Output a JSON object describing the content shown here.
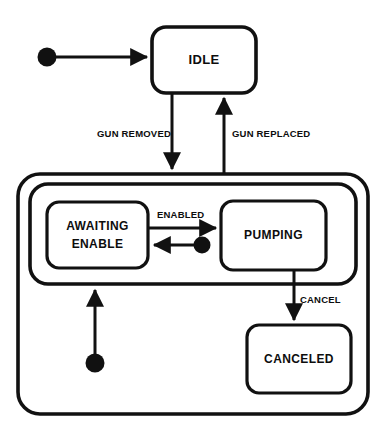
{
  "diagram": {
    "type": "uml-state-machine",
    "title": "",
    "colors": {
      "background": "#ffffff",
      "stroke": "#111111",
      "text": "#0d0d0d"
    },
    "states": [
      {
        "id": "idle",
        "label": "IDLE",
        "kind": "simple",
        "x": 152,
        "y": 27,
        "w": 104,
        "h": 66
      },
      {
        "id": "gun-out",
        "label": "",
        "kind": "composite-outer",
        "x": 18,
        "y": 174,
        "w": 350,
        "h": 240
      },
      {
        "id": "gun-out-inner",
        "label": "",
        "kind": "composite-inner",
        "x": 30,
        "y": 184,
        "w": 326,
        "h": 100
      },
      {
        "id": "awaiting-enable",
        "label-line1": "AWAITING",
        "label-line2": "ENABLE",
        "kind": "simple",
        "x": 47,
        "y": 202,
        "w": 101,
        "h": 66
      },
      {
        "id": "pumping",
        "label": "PUMPING",
        "kind": "simple",
        "x": 221,
        "y": 201,
        "w": 105,
        "h": 69
      },
      {
        "id": "canceled",
        "label": "CANCELED",
        "kind": "simple",
        "x": 247,
        "y": 325,
        "w": 104,
        "h": 68
      }
    ],
    "initial_nodes": [
      {
        "id": "initial-idle",
        "cx": 47,
        "cy": 57,
        "r": 9.5
      },
      {
        "id": "initial-awaiting",
        "cx": 202,
        "cy": 245,
        "r": 8.5
      },
      {
        "id": "initial-gun-out",
        "cx": 95,
        "cy": 363,
        "r": 9.5
      }
    ],
    "transitions": [
      {
        "id": "t-start-idle",
        "from": "initial-idle",
        "to": "idle",
        "label": ""
      },
      {
        "id": "t-idle-gunout",
        "from": "idle",
        "to": "gun-out",
        "label": "GUN REMOVED"
      },
      {
        "id": "t-gunout-idle",
        "from": "gun-out",
        "to": "idle",
        "label": "GUN REPLACED"
      },
      {
        "id": "t-awaiting-pumping",
        "from": "awaiting-enable",
        "to": "pumping",
        "label": "ENABLED"
      },
      {
        "id": "t-pumping-awaiting",
        "from": "initial-awaiting",
        "to": "awaiting-enable",
        "label": ""
      },
      {
        "id": "t-pumping-canceled",
        "from": "pumping",
        "to": "canceled",
        "label": "CANCEL"
      },
      {
        "id": "t-start-awaiting",
        "from": "initial-gun-out",
        "to": "gun-out-inner",
        "label": ""
      }
    ],
    "labels": {
      "gun_removed": "GUN REMOVED",
      "gun_replaced": "GUN REPLACED",
      "enabled": "ENABLED",
      "cancel": "CANCEL",
      "idle": "IDLE",
      "awaiting_line1": "AWAITING",
      "awaiting_line2": "ENABLE",
      "pumping": "PUMPING",
      "canceled": "CANCELED"
    }
  }
}
